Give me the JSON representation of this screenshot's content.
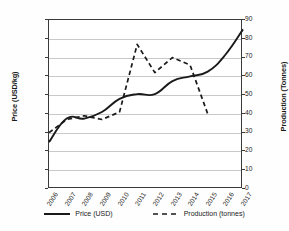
{
  "chart_data": {
    "type": "line",
    "title": "",
    "xlabel": "",
    "grid": true,
    "legend_position": "bottom",
    "categories": [
      "2006",
      "2007",
      "2008",
      "2009",
      "2010",
      "2011",
      "2012",
      "2013",
      "2014",
      "2015",
      "2016",
      "2017"
    ],
    "axes": {
      "left": {
        "label": "Price (USD/kg)",
        "min": 0.0,
        "max": 18.0,
        "step": 2.0,
        "ticks": [
          "0.00",
          "2.00",
          "4.00",
          "6.00",
          "8.00",
          "10.00",
          "12.00",
          "14.00",
          "16.00",
          "18.00"
        ]
      },
      "right": {
        "label": "Production (Tonnes)",
        "min": 0,
        "max": 90,
        "step": 10,
        "ticks": [
          "0",
          "10",
          "20",
          "30",
          "40",
          "50",
          "60",
          "70",
          "80",
          "90"
        ]
      }
    },
    "series": [
      {
        "name": "Price (USD)",
        "axis": "left",
        "style": "solid",
        "color": "#1a1a1a",
        "x": [
          "2006",
          "2007",
          "2008",
          "2009",
          "2010",
          "2011",
          "2012",
          "2013",
          "2014",
          "2015",
          "2016",
          "2017"
        ],
        "values": [
          5.0,
          7.5,
          7.5,
          8.2,
          9.6,
          10.1,
          10.1,
          11.5,
          12.0,
          12.5,
          14.3,
          17.0
        ]
      },
      {
        "name": "Production (tonnes)",
        "axis": "right",
        "style": "dashed",
        "color": "#1a1a1a",
        "x": [
          "2006",
          "2007",
          "2008",
          "2009",
          "2010",
          "2011",
          "2012",
          "2013",
          "2014",
          "2015"
        ],
        "values": [
          30,
          37,
          39,
          37,
          41,
          77,
          62,
          70,
          66,
          40
        ]
      }
    ]
  },
  "legend": {
    "items": [
      {
        "label": "Price (USD)",
        "style": "solid"
      },
      {
        "label": "Production (tonnes)",
        "style": "dashed"
      }
    ]
  }
}
